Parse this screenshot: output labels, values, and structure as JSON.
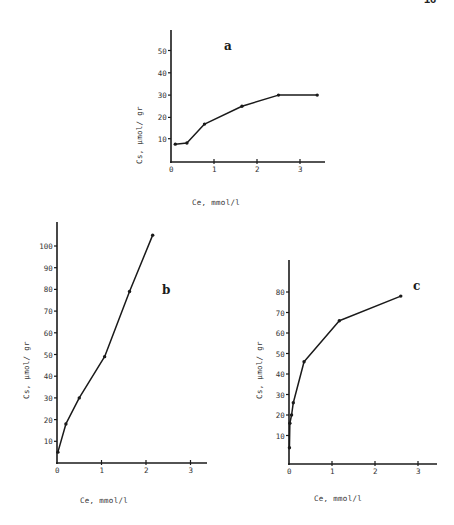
{
  "page": {
    "number_fragment": "16"
  },
  "chart_data": [
    {
      "id": "a",
      "type": "line",
      "panel_label": "a",
      "title": "",
      "xlabel": "Ce, mmol/l",
      "ylabel": "Cs, µmol/ gr",
      "xlim": [
        0,
        3.5
      ],
      "ylim": [
        0,
        60
      ],
      "x_ticks": [
        "0",
        "1",
        "2",
        "3"
      ],
      "y_ticks": [
        "10",
        "20",
        "30",
        "40",
        "50"
      ],
      "grid": false,
      "legend": null,
      "series": [
        {
          "name": "a",
          "x": [
            0.1,
            0.37,
            0.78,
            1.65,
            2.5,
            3.4
          ],
          "y": [
            8,
            8.5,
            17,
            25,
            30,
            30
          ]
        }
      ]
    },
    {
      "id": "b",
      "type": "line",
      "panel_label": "b",
      "title": "",
      "xlabel": "Ce, mmol/l",
      "ylabel": "Cs, µmol/ gr",
      "xlim": [
        0,
        3.2
      ],
      "ylim": [
        0,
        110
      ],
      "x_ticks": [
        "0",
        "1",
        "2",
        "3"
      ],
      "y_ticks": [
        "10",
        "20",
        "30",
        "40",
        "50",
        "60",
        "70",
        "80",
        "90",
        "100"
      ],
      "grid": false,
      "legend": null,
      "series": [
        {
          "name": "b",
          "x": [
            0.02,
            0.2,
            0.5,
            1.07,
            1.63,
            2.15
          ],
          "y": [
            5,
            18,
            30,
            49,
            79,
            105
          ]
        }
      ]
    },
    {
      "id": "c",
      "type": "line",
      "panel_label": "c",
      "title": "",
      "xlabel": "Ce, mmol/l",
      "ylabel": "Cs, µmol/ gr",
      "xlim": [
        0,
        3.2
      ],
      "ylim": [
        0,
        90
      ],
      "x_ticks": [
        "0",
        "1",
        "2",
        "3"
      ],
      "y_ticks": [
        "10",
        "20",
        "30",
        "40",
        "50",
        "60",
        "70",
        "80"
      ],
      "grid": false,
      "legend": null,
      "series": [
        {
          "name": "c",
          "x": [
            0.01,
            0.02,
            0.06,
            0.1,
            0.35,
            1.17,
            2.6
          ],
          "y": [
            4,
            16,
            20,
            26,
            46,
            66,
            78
          ]
        }
      ]
    }
  ]
}
